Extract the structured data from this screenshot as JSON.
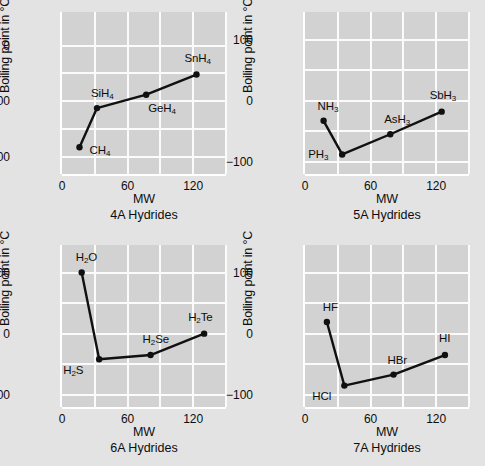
{
  "figure": {
    "background_color": "#e3e3e3",
    "panel_background_color": "#d2d2d2",
    "gridline_color": "#fbfbfb",
    "series_color": "#101010"
  },
  "chart_data": [
    {
      "type": "line",
      "title": "",
      "subtitle": "4A Hydrides",
      "xlabel": "MW",
      "ylabel": "Boiling point in °C",
      "xlim": [
        0,
        150
      ],
      "ylim": [
        -230,
        60
      ],
      "xticks": [
        0,
        60,
        120
      ],
      "xticklabels": [
        "0",
        "60",
        "120"
      ],
      "yticks": [
        0,
        -100,
        -200
      ],
      "yticklabels": [
        "0",
        "−100",
        "−200"
      ],
      "x_minor_gridlines": [
        30,
        90,
        150
      ],
      "y_minor_gridlines": [
        -50,
        -150
      ],
      "grid": true,
      "legend": "none",
      "point_labels": [
        "CH₄",
        "SiH₄",
        "GeH₄",
        "SnH₄"
      ],
      "x": [
        16,
        32,
        77,
        123
      ],
      "y": [
        -182,
        -112,
        -88,
        -52
      ],
      "points": [
        {
          "label": "CH₄",
          "mw": 16,
          "bp": -182,
          "label_dx": 10,
          "label_dy": -2
        },
        {
          "label": "SiH₄",
          "mw": 32,
          "bp": -112,
          "label_dx": -6,
          "label_dy": -20
        },
        {
          "label": "GeH₄",
          "mw": 77,
          "bp": -88,
          "label_dx": 2,
          "label_dy": 8
        },
        {
          "label": "SnH₄",
          "mw": 123,
          "bp": -52,
          "label_dx": -12,
          "label_dy": -22
        }
      ]
    },
    {
      "type": "line",
      "title": "",
      "subtitle": "5A Hydrides",
      "xlabel": "MW",
      "ylabel": "Boiling point in °C",
      "xlim": [
        0,
        150
      ],
      "ylim": [
        -120,
        145
      ],
      "xticks": [
        0,
        60,
        120
      ],
      "xticklabels": [
        "0",
        "60",
        "120"
      ],
      "yticks": [
        100,
        0,
        -100
      ],
      "yticklabels": [
        "100",
        "0",
        "−100"
      ],
      "x_minor_gridlines": [
        30,
        90,
        150
      ],
      "y_minor_gridlines": [
        50,
        -50
      ],
      "grid": true,
      "legend": "none",
      "point_labels": [
        "NH₃",
        "PH₃",
        "AsH₃",
        "SbH₃"
      ],
      "x": [
        17,
        34,
        78,
        125
      ],
      "y": [
        -33,
        -88,
        -55,
        -18
      ],
      "points": [
        {
          "label": "NH₃",
          "mw": 17,
          "bp": -33,
          "label_dx": -6,
          "label_dy": -20
        },
        {
          "label": "PH₃",
          "mw": 34,
          "bp": -88,
          "label_dx": -34,
          "label_dy": -5
        },
        {
          "label": "AsH₃",
          "mw": 78,
          "bp": -55,
          "label_dx": -6,
          "label_dy": -20
        },
        {
          "label": "SbH₃",
          "mw": 125,
          "bp": -18,
          "label_dx": -12,
          "label_dy": -22
        }
      ]
    },
    {
      "type": "line",
      "title": "",
      "subtitle": "6A Hydrides",
      "xlabel": "MW",
      "ylabel": "Boiling point in °C",
      "xlim": [
        0,
        150
      ],
      "ylim": [
        -120,
        145
      ],
      "xticks": [
        0,
        60,
        120
      ],
      "xticklabels": [
        "0",
        "60",
        "120"
      ],
      "yticks": [
        100,
        0,
        -100
      ],
      "yticklabels": [
        "100",
        "0",
        "−100"
      ],
      "x_minor_gridlines": [
        30,
        90,
        150
      ],
      "y_minor_gridlines": [
        50,
        -50
      ],
      "grid": true,
      "legend": "none",
      "point_labels": [
        "H₂O",
        "H₂S",
        "H₂Se",
        "H₂Te"
      ],
      "x": [
        18,
        34,
        81,
        130
      ],
      "y": [
        100,
        -42,
        -35,
        0
      ],
      "points": [
        {
          "label": "H₂O",
          "mw": 18,
          "bp": 100,
          "label_dx": -6,
          "label_dy": -21
        },
        {
          "label": "H₂S",
          "mw": 34,
          "bp": -42,
          "label_dx": -36,
          "label_dy": 6
        },
        {
          "label": "H₂Se",
          "mw": 81,
          "bp": -35,
          "label_dx": -8,
          "label_dy": -21
        },
        {
          "label": "H₂Te",
          "mw": 130,
          "bp": 0,
          "label_dx": -16,
          "label_dy": -22
        }
      ]
    },
    {
      "type": "line",
      "title": "",
      "subtitle": "7A Hydrides",
      "xlabel": "MW",
      "ylabel": "Boiling point in °C",
      "xlim": [
        0,
        150
      ],
      "ylim": [
        -120,
        145
      ],
      "xticks": [
        0,
        60,
        120
      ],
      "xticklabels": [
        "0",
        "60",
        "120"
      ],
      "yticks": [
        100,
        0,
        -100
      ],
      "yticklabels": [
        "100",
        "0",
        "−100"
      ],
      "x_minor_gridlines": [
        30,
        90,
        150
      ],
      "y_minor_gridlines": [
        50,
        -50
      ],
      "grid": true,
      "legend": "none",
      "point_labels": [
        "HF",
        "HCl",
        "HBr",
        "HI"
      ],
      "x": [
        20,
        36,
        81,
        128
      ],
      "y": [
        19,
        -85,
        -67,
        -35
      ],
      "points": [
        {
          "label": "HF",
          "mw": 20,
          "bp": 19,
          "label_dx": -4,
          "label_dy": -20
        },
        {
          "label": "HCl",
          "mw": 36,
          "bp": -85,
          "label_dx": -32,
          "label_dy": 5
        },
        {
          "label": "HBr",
          "mw": 81,
          "bp": -67,
          "label_dx": -6,
          "label_dy": -20
        },
        {
          "label": "HI",
          "mw": 128,
          "bp": -35,
          "label_dx": -6,
          "label_dy": -22
        }
      ]
    }
  ]
}
